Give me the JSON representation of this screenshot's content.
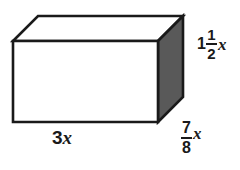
{
  "figure": {
    "name": "rectangular-prism-diagram",
    "shape": "rectangular prism",
    "background_color": "#ffffff",
    "stroke_color": "#1a1a1a",
    "front_face_color": "#ffffff",
    "top_face_color": "#ffffff",
    "right_face_color": "#595959",
    "text_color": "#1a1a1a"
  },
  "labels": {
    "length": {
      "text": "3x",
      "coefficient": "3",
      "variable": "x",
      "edge": "bottom-front"
    },
    "height": {
      "whole": "1",
      "numerator": "1",
      "denominator": "2",
      "variable": "x",
      "text": "1 1/2 x",
      "edge": "right-vertical"
    },
    "depth": {
      "numerator": "7",
      "denominator": "8",
      "variable": "x",
      "text": "7/8 x",
      "edge": "bottom-right-oblique"
    }
  },
  "geometry": {
    "front_face": "13,41 158,41 158,122 13,122",
    "top_face": "13,41 38,16 183,16 158,41",
    "right_face": "158,41 183,16 183,97 158,122",
    "stroke_width": 2.6
  }
}
